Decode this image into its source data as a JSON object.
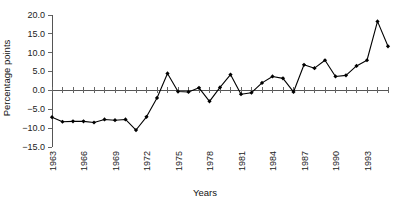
{
  "chart_data": {
    "type": "line",
    "title": "",
    "subtitle": "",
    "xlabel": "Years",
    "ylabel": "Percentage points",
    "grid": false,
    "legend": false,
    "legend_position": "none",
    "xlim": [
      1963,
      1995
    ],
    "ylim": [
      -15.0,
      20.0
    ],
    "ytick_labels": [
      "20.0",
      "15.0",
      "10.0",
      "5.0",
      "0.0",
      "−5.0",
      "−10.0",
      "−15.0"
    ],
    "ytick_values": [
      20.0,
      15.0,
      10.0,
      5.0,
      0.0,
      -5.0,
      -10.0,
      -15.0
    ],
    "xtick_labels": [
      "1963",
      "1966",
      "1969",
      "1972",
      "1975",
      "1978",
      "1981",
      "1984",
      "1987",
      "1990",
      "1993"
    ],
    "xtick_values": [
      1963,
      1966,
      1969,
      1972,
      1975,
      1978,
      1981,
      1984,
      1987,
      1990,
      1993
    ],
    "x": [
      1963,
      1964,
      1965,
      1966,
      1967,
      1968,
      1969,
      1970,
      1971,
      1972,
      1973,
      1974,
      1975,
      1976,
      1977,
      1978,
      1979,
      1980,
      1981,
      1982,
      1983,
      1984,
      1985,
      1986,
      1987,
      1988,
      1989,
      1990,
      1991,
      1992,
      1993,
      1994,
      1995
    ],
    "values": [
      -7.1,
      -8.3,
      -8.2,
      -8.2,
      -8.5,
      -7.7,
      -7.9,
      -7.7,
      -10.5,
      -7.0,
      -2.0,
      4.5,
      -0.3,
      -0.4,
      0.7,
      -2.9,
      0.8,
      4.2,
      -1.0,
      -0.6,
      2.0,
      3.7,
      3.2,
      -0.4,
      6.8,
      5.9,
      8.0,
      3.7,
      4.0,
      6.5,
      8.0,
      18.3,
      11.7
    ],
    "series": [
      {
        "name": "Percentage points",
        "color": "#000000",
        "marker": "diamond",
        "values": [
          -7.1,
          -8.3,
          -8.2,
          -8.2,
          -8.5,
          -7.7,
          -7.9,
          -7.7,
          -10.5,
          -7.0,
          -2.0,
          4.5,
          -0.3,
          -0.4,
          0.7,
          -2.9,
          0.8,
          4.2,
          -1.0,
          -0.6,
          2.0,
          3.7,
          3.2,
          -0.4,
          6.8,
          5.9,
          8.0,
          3.7,
          4.0,
          6.5,
          8.0,
          18.3,
          11.7
        ]
      }
    ],
    "annotations": []
  },
  "colors": {
    "background": "#ffffff",
    "series": "#000000",
    "axis": "#555555",
    "text": "#111111"
  }
}
